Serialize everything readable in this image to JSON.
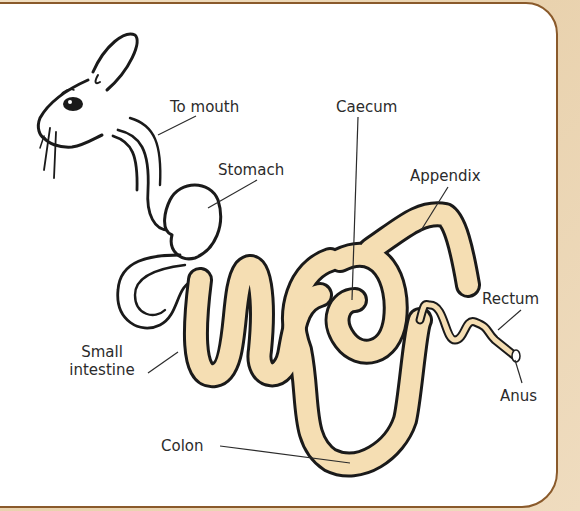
{
  "diagram": {
    "labels": {
      "to_mouth": "To mouth",
      "stomach": "Stomach",
      "caecum": "Caecum",
      "appendix": "Appendix",
      "rectum": "Rectum",
      "small_intestine_line1": "Small",
      "small_intestine_line2": "intestine",
      "anus": "Anus",
      "colon": "Colon"
    },
    "colors": {
      "background": "#eed9b8",
      "border": "#8a5a2b",
      "gut_fill": "#f5deb3",
      "outline": "#1a1a1a"
    }
  }
}
